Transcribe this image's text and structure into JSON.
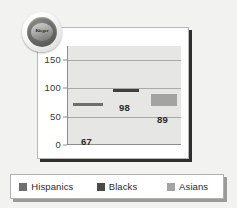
{
  "logo": {
    "name": "kieger-seal-logo",
    "text": "Kieger"
  },
  "legend": {
    "items": [
      {
        "label": "Hispanics",
        "color": "#6e6e6c"
      },
      {
        "label": "Blacks",
        "color": "#4a4a48"
      },
      {
        "label": "Asians",
        "color": "#a3a3a1"
      }
    ]
  },
  "chart_data": {
    "type": "bar",
    "title": "",
    "subtitle": "",
    "xlabel": "",
    "ylabel": "",
    "categories": [
      "Hispanics",
      "Blacks",
      "Asians"
    ],
    "values": [
      67,
      98,
      89
    ],
    "series": [
      {
        "name": "Population",
        "values": [
          67,
          98,
          89
        ]
      }
    ],
    "data_labels": [
      "67",
      "98",
      "89"
    ],
    "bar_colors": [
      "#6e6e6c",
      "#3f3f3d",
      "#a3a3a1"
    ],
    "ylim": [
      0,
      175
    ],
    "yticks": [
      0,
      50,
      100,
      150
    ],
    "ytick_labels": [
      "0",
      "50",
      "100",
      "150"
    ],
    "gridlines": [
      50,
      100,
      150
    ],
    "grid": true,
    "legend_position": "bottom",
    "plot_background": "#e6e6e4"
  }
}
